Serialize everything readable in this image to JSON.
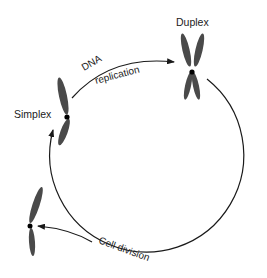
{
  "diagram": {
    "type": "cycle",
    "nodes": [
      {
        "id": "duplex",
        "label": "Duplex",
        "shape": "x-chromosome-icon"
      },
      {
        "id": "simplex",
        "label": "Simplex",
        "shape": "single-chromatid-icon"
      },
      {
        "id": "daughter",
        "label": "",
        "shape": "single-chromatid-icon"
      }
    ],
    "edges": [
      {
        "from": "simplex",
        "to": "duplex",
        "label_line1": "DNA",
        "label_line2": "replication"
      },
      {
        "from": "duplex",
        "to": "simplex",
        "label": ""
      },
      {
        "from": "duplex",
        "to": "daughter",
        "label": "Cell division"
      }
    ],
    "colors": {
      "chromatid": "#4a4a4a",
      "centromere": "#000000",
      "arrow": "#1a1a1a",
      "text": "#222222"
    }
  }
}
